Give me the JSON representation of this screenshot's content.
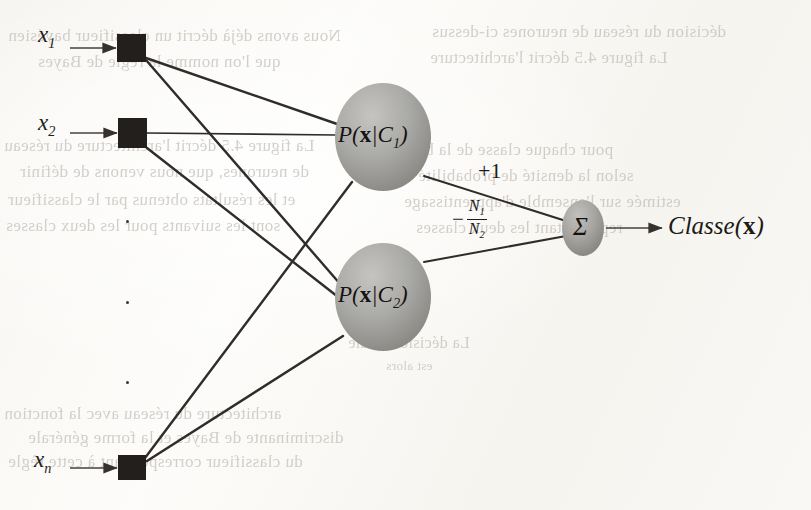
{
  "figure": {
    "background_note": "scanned book page with faint show-through text"
  },
  "inputs": [
    {
      "id": "x1",
      "label": "x",
      "subscript": "1",
      "label_x": 38,
      "label_y": 22,
      "node_x": 117,
      "node_y": 34,
      "node_w": 29,
      "node_h": 28
    },
    {
      "id": "x2",
      "label": "x",
      "subscript": "2",
      "label_x": 38,
      "label_y": 110,
      "node_x": 118,
      "node_y": 118,
      "node_w": 29,
      "node_h": 30
    },
    {
      "id": "xn",
      "label": "x",
      "subscript": "n",
      "label_x": 34,
      "label_y": 447,
      "node_x": 118,
      "node_y": 455,
      "node_w": 28,
      "node_h": 25
    }
  ],
  "ellipsis_dots": [
    {
      "x": 126,
      "y": 220
    },
    {
      "x": 126,
      "y": 301
    },
    {
      "x": 126,
      "y": 381
    }
  ],
  "hidden_nodes": [
    {
      "id": "pdf-c1",
      "text_p": "P(",
      "text_x": "x",
      "text_bar": "|",
      "text_c": "C",
      "text_sub": "1",
      "text_close": ")",
      "full": "P(x|C1)",
      "cx": 383,
      "cy": 137,
      "rx": 48,
      "ry": 54
    },
    {
      "id": "pdf-c2",
      "text_p": "P(",
      "text_x": "x",
      "text_bar": "|",
      "text_c": "C",
      "text_sub": "2",
      "text_close": ")",
      "full": "P(x|C2)",
      "cx": 383,
      "cy": 297,
      "rx": 48,
      "ry": 54
    }
  ],
  "summation_node": {
    "id": "sigma",
    "glyph": "Σ",
    "cx": 583,
    "cy": 228,
    "rx": 21,
    "ry": 28
  },
  "weights": [
    {
      "id": "w-positive",
      "label": "+1",
      "x": 478,
      "y": 158
    },
    {
      "id": "w-negative",
      "minus": "−",
      "numerator": "N",
      "numerator_sub": "1",
      "denominator": "N",
      "denominator_sub": "2",
      "full": "-N1/N2",
      "x": 452,
      "y": 198
    }
  ],
  "output": {
    "id": "classe-output",
    "label_classe": "Classe",
    "label_open": "(",
    "label_x": "x",
    "label_close": ")",
    "full": "Classe(x)",
    "x": 668,
    "y": 212
  },
  "ghost_text_lines": [
    {
      "text": "Nous avons déjà décrit un classifieur bayésien",
      "x": 8,
      "y": 26,
      "size": 17
    },
    {
      "text": "que l'on nomme la règle de Bayes",
      "x": 38,
      "y": 52,
      "size": 17
    },
    {
      "text": "La figure 4.5 décrit l'architecture du réseau",
      "x": 4,
      "y": 136,
      "size": 17
    },
    {
      "text": "de neurones, que nous venons de définir",
      "x": 20,
      "y": 162,
      "size": 17
    },
    {
      "text": "et les résultats obtenus par le classifieur",
      "x": 8,
      "y": 190,
      "size": 17
    },
    {
      "text": "sont les suivants pour les deux classes",
      "x": 6,
      "y": 216,
      "size": 17
    },
    {
      "text": "décision du réseau de neurones ci-dessus",
      "x": 432,
      "y": 22,
      "size": 17
    },
    {
      "text": "La figure 4.5 décrit l'architecture",
      "x": 430,
      "y": 48,
      "size": 17
    },
    {
      "text": "pour chaque classe de la base",
      "x": 402,
      "y": 140,
      "size": 17
    },
    {
      "text": "selon la densité de probabilité",
      "x": 418,
      "y": 166,
      "size": 17
    },
    {
      "text": "estimée sur l'ensemble d'apprentissage",
      "x": 404,
      "y": 192,
      "size": 17
    },
    {
      "text": "représentant les deux classes",
      "x": 416,
      "y": 218,
      "size": 17
    },
    {
      "text": "La décision finale",
      "x": 348,
      "y": 334,
      "size": 16
    },
    {
      "text": "est alors",
      "x": 386,
      "y": 358,
      "size": 13
    },
    {
      "text": "architecture du réseau avec la fonction",
      "x": 4,
      "y": 404,
      "size": 17
    },
    {
      "text": "discriminante de Bayes et la forme générale",
      "x": 28,
      "y": 428,
      "size": 17
    },
    {
      "text": "du classifieur correspondant à cette règle",
      "x": 8,
      "y": 452,
      "size": 17
    }
  ],
  "colors": {
    "ink": "#231f1d",
    "edge": "#2f2c2a",
    "node_fill": "#231f1d",
    "ellipse_fill_light": "#b9b7b4",
    "ellipse_fill_dark": "#8d8b88",
    "paper": "#faf8f5",
    "ghost": "#b9b4ad"
  }
}
